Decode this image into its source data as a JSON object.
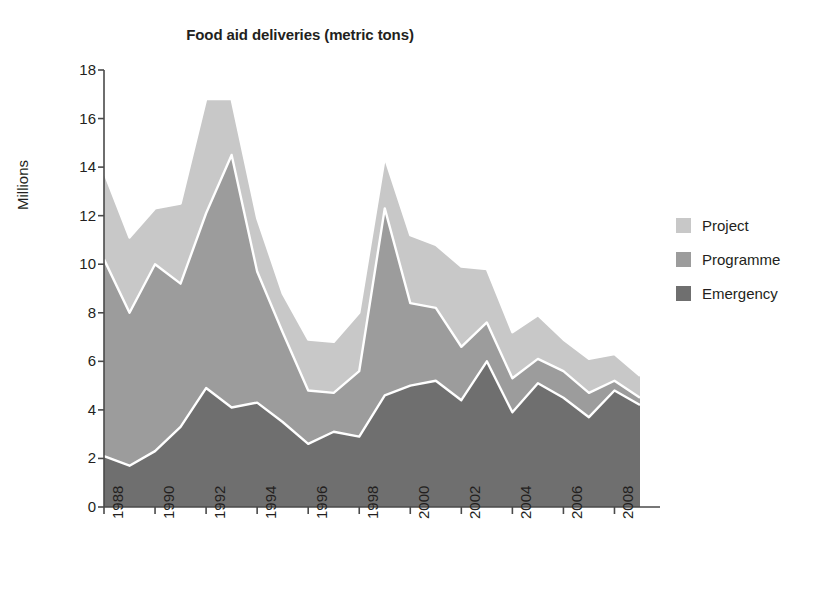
{
  "chart_data": {
    "type": "area",
    "stacked": true,
    "title": "Food aid deliveries (metric tons)",
    "xlabel": "",
    "ylabel": "Millions",
    "ylim": [
      0,
      18
    ],
    "ytick_step": 2,
    "yticks": [
      "0",
      "2",
      "4",
      "6",
      "8",
      "10",
      "12",
      "14",
      "16",
      "18"
    ],
    "xlim": [
      1988,
      2009
    ],
    "xticks": [
      "1988",
      "1990",
      "1992",
      "1994",
      "1996",
      "1998",
      "2000",
      "2002",
      "2004",
      "2006",
      "2008"
    ],
    "x": [
      1988,
      1989,
      1990,
      1991,
      1992,
      1993,
      1994,
      1995,
      1996,
      1997,
      1998,
      1999,
      2000,
      2001,
      2002,
      2003,
      2004,
      2005,
      2006,
      2007,
      2008,
      2009
    ],
    "grid": false,
    "legend_position": "right",
    "series": [
      {
        "name": "Emergency",
        "color": "#6f6f6f",
        "values": [
          2.1,
          1.7,
          2.3,
          3.3,
          4.9,
          4.1,
          4.3,
          3.5,
          2.6,
          3.1,
          2.9,
          4.6,
          5.0,
          5.2,
          4.4,
          6.0,
          3.9,
          5.1,
          4.5,
          3.7,
          4.8,
          4.2
        ]
      },
      {
        "name": "Programme",
        "color": "#9c9c9c",
        "values": [
          8.1,
          6.3,
          7.7,
          5.9,
          7.2,
          10.4,
          5.4,
          3.7,
          2.2,
          1.6,
          2.7,
          7.7,
          3.4,
          3.0,
          2.2,
          1.6,
          1.4,
          1.0,
          1.1,
          1.0,
          0.4,
          0.3
        ]
      },
      {
        "name": "Project",
        "color": "#c8c8c8",
        "values": [
          3.6,
          3.1,
          2.3,
          3.3,
          4.7,
          2.3,
          2.2,
          1.6,
          2.1,
          2.1,
          2.4,
          2.1,
          2.8,
          2.6,
          3.3,
          2.2,
          1.9,
          1.8,
          1.3,
          1.4,
          1.1,
          0.9
        ]
      }
    ],
    "totals": [
      13.8,
      11.1,
      12.3,
      12.5,
      16.8,
      16.8,
      11.9,
      8.8,
      6.9,
      6.8,
      8.0,
      14.4,
      11.2,
      10.8,
      9.9,
      9.8,
      7.2,
      7.9,
      6.9,
      6.1,
      6.3,
      5.4
    ]
  },
  "legend": {
    "items": [
      {
        "label": "Project",
        "color": "#c8c8c8"
      },
      {
        "label": "Programme",
        "color": "#9c9c9c"
      },
      {
        "label": "Emergency",
        "color": "#6f6f6f"
      }
    ]
  },
  "axes": {
    "y_title": "Millions",
    "axis_color": "#4a4a4a",
    "separator_color": "#ffffff"
  }
}
